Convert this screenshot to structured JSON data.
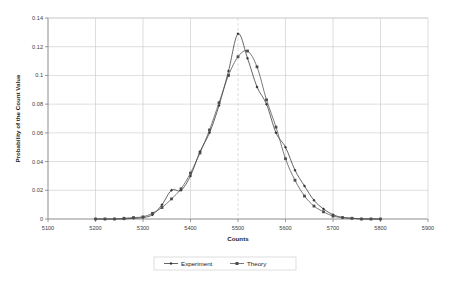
{
  "chart_data": {
    "type": "line",
    "title": "",
    "xlabel": "Counts",
    "ylabel": "Probability of the Count Value",
    "xlim": [
      5100,
      5900
    ],
    "ylim": [
      0,
      0.14
    ],
    "xticks": [
      5100,
      5200,
      5300,
      5400,
      5500,
      5600,
      5700,
      5800,
      5900
    ],
    "yticks": [
      0,
      0.02,
      0.04,
      0.06,
      0.08,
      0.1,
      0.12,
      0.14
    ],
    "xtick_labels": [
      "5100",
      "5200",
      "5300",
      "5400",
      "5500",
      "5600",
      "5700",
      "5800",
      "5900"
    ],
    "ytick_labels": [
      "0",
      "0.02",
      "0.04",
      "0.06",
      "0.08",
      "0.1",
      "0.12",
      "0.14"
    ],
    "grid": true,
    "grid_color": "#c8c8c8",
    "legend_position": "bottom",
    "x": [
      5200,
      5220,
      5240,
      5260,
      5280,
      5300,
      5320,
      5340,
      5360,
      5380,
      5400,
      5420,
      5440,
      5460,
      5480,
      5500,
      5520,
      5540,
      5560,
      5580,
      5600,
      5620,
      5640,
      5660,
      5680,
      5700,
      5720,
      5740,
      5760,
      5780,
      5800
    ],
    "series": [
      {
        "name": "Experiment",
        "marker": "diamond",
        "color": "#333333",
        "values": [
          0.0,
          0.0,
          0.0,
          0.0,
          0.0005,
          0.001,
          0.003,
          0.01,
          0.02,
          0.02,
          0.03,
          0.047,
          0.06,
          0.079,
          0.103,
          0.129,
          0.112,
          0.092,
          0.08,
          0.06,
          0.05,
          0.034,
          0.023,
          0.013,
          0.007,
          0.003,
          0.001,
          0.0005,
          0.0,
          0.0,
          0.0
        ]
      },
      {
        "name": "Theory",
        "marker": "square",
        "color": "#4d4d4d",
        "values": [
          0.0,
          0.0,
          0.0,
          0.0005,
          0.001,
          0.0015,
          0.004,
          0.008,
          0.014,
          0.021,
          0.032,
          0.046,
          0.062,
          0.081,
          0.1,
          0.113,
          0.117,
          0.106,
          0.083,
          0.064,
          0.042,
          0.027,
          0.016,
          0.009,
          0.005,
          0.002,
          0.001,
          0.0005,
          0.0,
          0.0,
          0.0
        ]
      }
    ]
  },
  "legend": {
    "items": [
      {
        "label": "Experiment"
      },
      {
        "label": "Theory"
      }
    ]
  }
}
